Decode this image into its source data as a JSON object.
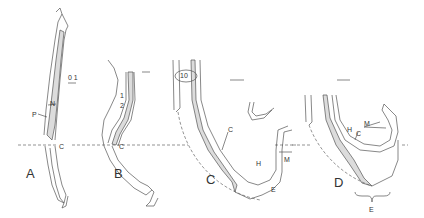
{
  "figure": {
    "panels": [
      {
        "id": "A",
        "label": "A",
        "annotations": [
          "P",
          "N",
          "C"
        ],
        "scale_bar": "0.1"
      },
      {
        "id": "B",
        "label": "B",
        "annotations": [
          "1",
          "2",
          "C"
        ]
      },
      {
        "id": "C",
        "label": "C",
        "annotations": [
          "10",
          "C",
          "H",
          "M",
          "E"
        ]
      },
      {
        "id": "D",
        "label": "D",
        "annotations": [
          "H",
          "C",
          "M",
          "E"
        ]
      }
    ],
    "labels": {
      "A": "A",
      "B": "B",
      "C": "C",
      "D": "D",
      "a_P": "P",
      "a_N": "N",
      "a_C": "C",
      "a_scale": "0 1",
      "b_1": "1",
      "b_2": "2",
      "b_C": "C",
      "c_10": "10",
      "c_C": "C",
      "c_H": "H",
      "c_M": "M",
      "c_E": "E",
      "d_H": "H",
      "d_C": "C",
      "d_M": "M",
      "d_E": "E"
    },
    "colors": {
      "line": "#555555",
      "shade": "#dcdcdc",
      "background": "#ffffff"
    }
  }
}
